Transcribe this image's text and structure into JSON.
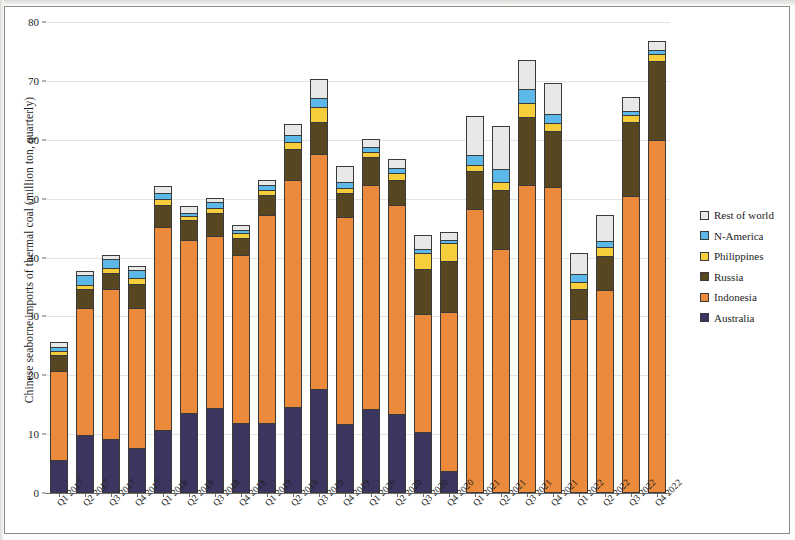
{
  "chart_data": {
    "type": "bar",
    "stacked": true,
    "title": "",
    "xlabel": "",
    "ylabel": "Chinese seaborne imports of thermal coal (million ton, quarterly)",
    "ylim": [
      0,
      80
    ],
    "yticks": [
      0,
      10,
      20,
      30,
      40,
      50,
      60,
      70,
      80
    ],
    "grid": true,
    "legend_position": "right",
    "categories": [
      "Q1 2017",
      "Q2 2017",
      "Q3 2017",
      "Q4 2017",
      "Q1 2018",
      "Q2 2018",
      "Q3 2018",
      "Q4 2018",
      "Q1 2019",
      "Q2 2019",
      "Q3 2019",
      "Q4 2019",
      "Q1 2020",
      "Q2 2020",
      "Q3 2020",
      "Q4 2020",
      "Q1 2021",
      "Q2 2021",
      "Q3 2021",
      "Q4 2021",
      "Q1 2022",
      "Q2 2022",
      "Q3 2022",
      "Q4 2022"
    ],
    "series": [
      {
        "name": "Australia",
        "color": "#3c3560",
        "values": [
          5.6,
          9.9,
          9.1,
          7.6,
          10.7,
          13.6,
          14.5,
          11.9,
          11.9,
          14.6,
          17.6,
          11.8,
          14.2,
          13.5,
          10.4,
          3.8,
          0.0,
          0.0,
          0.0,
          0.0,
          0.0,
          0.0,
          0.0,
          0.0
        ]
      },
      {
        "name": "Indonesia",
        "color": "#ec8a3b",
        "values": [
          15.2,
          21.6,
          25.6,
          23.9,
          34.5,
          29.4,
          29.2,
          28.5,
          35.4,
          38.5,
          40.0,
          35.1,
          38.2,
          35.5,
          20.0,
          27.0,
          48.2,
          41.5,
          52.4,
          51.9,
          29.5,
          34.4,
          50.4,
          59.9
        ]
      },
      {
        "name": "Russia",
        "color": "#574720",
        "values": [
          2.7,
          3.2,
          2.6,
          4.0,
          3.8,
          3.3,
          3.9,
          3.0,
          3.4,
          5.3,
          5.4,
          4.0,
          4.6,
          4.2,
          7.6,
          8.6,
          6.5,
          9.9,
          11.4,
          9.6,
          5.1,
          5.9,
          12.7,
          13.4
        ]
      },
      {
        "name": "Philippines",
        "color": "#f6ce3c",
        "values": [
          0.7,
          0.7,
          0.9,
          1.1,
          1.0,
          0.8,
          0.8,
          0.7,
          0.8,
          1.2,
          2.6,
          0.9,
          1.0,
          1.1,
          2.8,
          3.0,
          1.1,
          1.5,
          2.4,
          1.3,
          1.3,
          1.5,
          1.1,
          1.3
        ]
      },
      {
        "name": "N-America",
        "color": "#5bb8e8",
        "values": [
          0.6,
          1.6,
          1.6,
          1.2,
          0.9,
          0.5,
          1.0,
          0.5,
          0.8,
          1.2,
          1.5,
          1.1,
          0.7,
          0.9,
          0.7,
          0.5,
          1.7,
          2.1,
          2.5,
          1.6,
          1.3,
          1.0,
          0.7,
          0.6
        ]
      },
      {
        "name": "Rest of world",
        "color": "#e8e8e6",
        "values": [
          0.8,
          0.7,
          0.7,
          0.8,
          1.3,
          1.1,
          0.8,
          0.9,
          0.9,
          1.8,
          3.2,
          2.6,
          1.5,
          1.5,
          2.3,
          1.5,
          6.5,
          7.3,
          4.9,
          5.2,
          3.5,
          4.4,
          2.3,
          1.6
        ]
      }
    ]
  },
  "legend": {
    "items": [
      {
        "label": "Rest of world",
        "color": "#e8e8e6"
      },
      {
        "label": "N-America",
        "color": "#5bb8e8"
      },
      {
        "label": "Philippines",
        "color": "#f6ce3c"
      },
      {
        "label": "Russia",
        "color": "#574720"
      },
      {
        "label": "Indonesia",
        "color": "#ec8a3b"
      },
      {
        "label": "Australia",
        "color": "#3c3560"
      }
    ]
  },
  "axes": {
    "y_title": "Chinese seaborne imports of thermal coal (million ton, quarterly)",
    "y_tick_labels": [
      "0",
      "10",
      "20",
      "30",
      "40",
      "50",
      "60",
      "70",
      "80"
    ]
  }
}
